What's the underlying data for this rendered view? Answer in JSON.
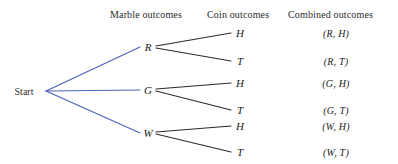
{
  "figure": {
    "type": "probability-tree-diagram",
    "background_color": "#ffffff",
    "stage1_branch_color": "#4A63BE",
    "stage2_branch_color": "#2b2b2b",
    "width": 398,
    "height": 164
  },
  "headers": [
    {
      "label": "Marble outcomes",
      "x": 147,
      "y": 15
    },
    {
      "label": "Coin outcomes",
      "x": 238,
      "y": 15
    },
    {
      "label": "Combined outcomes",
      "x": 336,
      "y": 15
    }
  ],
  "root": {
    "label": "Start",
    "x": 24,
    "y": 91,
    "branch_x": 46,
    "branch_y": 91
  },
  "stage1": {
    "name": "Marble outcomes",
    "nodes": [
      {
        "label": "R",
        "x": 148,
        "y": 47
      },
      {
        "label": "G",
        "x": 148,
        "y": 90
      },
      {
        "label": "W",
        "x": 148,
        "y": 133
      }
    ]
  },
  "stage2": {
    "name": "Coin outcomes",
    "nodes": [
      {
        "label": "H",
        "x": 240,
        "y": 33,
        "parent": "R"
      },
      {
        "label": "T",
        "x": 240,
        "y": 61,
        "parent": "R"
      },
      {
        "label": "H",
        "x": 240,
        "y": 83,
        "parent": "G"
      },
      {
        "label": "T",
        "x": 240,
        "y": 110,
        "parent": "G"
      },
      {
        "label": "H",
        "x": 240,
        "y": 126,
        "parent": "W"
      },
      {
        "label": "T",
        "x": 240,
        "y": 152,
        "parent": "W"
      }
    ]
  },
  "combined": {
    "name": "Combined outcomes",
    "items": [
      {
        "label": "(R, H)",
        "x": 336,
        "y": 33
      },
      {
        "label": "(R, T)",
        "x": 336,
        "y": 61
      },
      {
        "label": "(G, H)",
        "x": 336,
        "y": 83
      },
      {
        "label": "(G, T)",
        "x": 336,
        "y": 110
      },
      {
        "label": "(W, H)",
        "x": 336,
        "y": 126
      },
      {
        "label": "(W, T)",
        "x": 336,
        "y": 152
      }
    ]
  },
  "edges": {
    "stage1": [
      {
        "from": "Start",
        "to": "R",
        "x1": 46,
        "y1": 91,
        "x2": 140,
        "y2": 47
      },
      {
        "from": "Start",
        "to": "G",
        "x1": 46,
        "y1": 91,
        "x2": 140,
        "y2": 90
      },
      {
        "from": "Start",
        "to": "W",
        "x1": 46,
        "y1": 91,
        "x2": 140,
        "y2": 133
      }
    ],
    "stage2": [
      {
        "from": "R",
        "to": "H",
        "x1": 156,
        "y1": 46,
        "x2": 231,
        "y2": 33
      },
      {
        "from": "R",
        "to": "T",
        "x1": 156,
        "y1": 48,
        "x2": 231,
        "y2": 61
      },
      {
        "from": "G",
        "to": "H",
        "x1": 156,
        "y1": 89,
        "x2": 231,
        "y2": 83
      },
      {
        "from": "G",
        "to": "T",
        "x1": 156,
        "y1": 91,
        "x2": 231,
        "y2": 110
      },
      {
        "from": "W",
        "to": "H",
        "x1": 156,
        "y1": 132,
        "x2": 231,
        "y2": 126
      },
      {
        "from": "W",
        "to": "T",
        "x1": 156,
        "y1": 134,
        "x2": 231,
        "y2": 152
      }
    ]
  }
}
